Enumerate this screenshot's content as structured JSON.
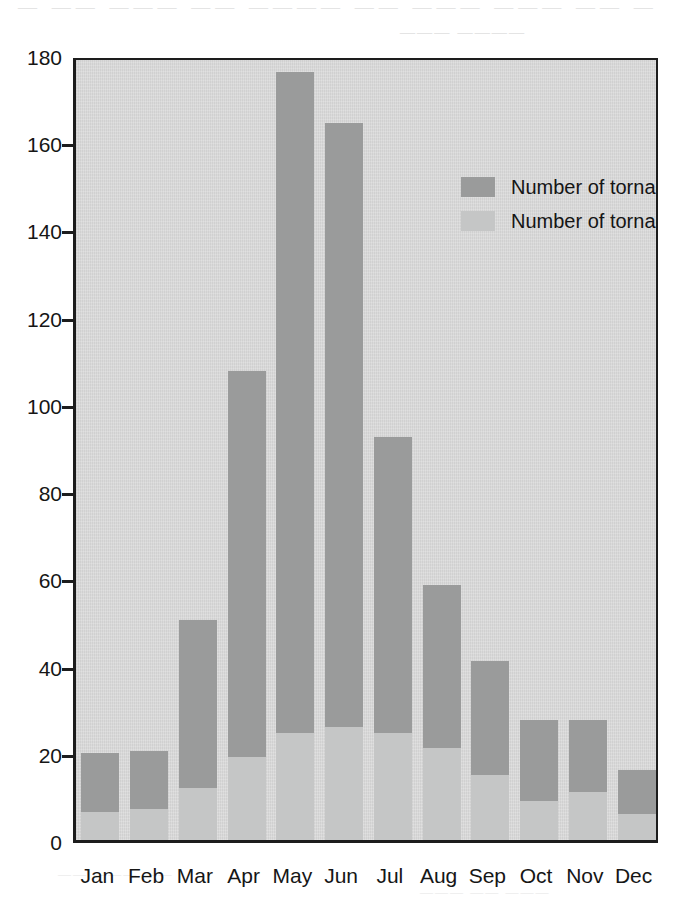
{
  "scan_artifacts": {
    "top_line": "— —— ——— —— ———— —— ——— ——— —— —",
    "sub_line": "——— ————",
    "low_line_a": "—— ——— ——",
    "low_line_b": "——— —— ———"
  },
  "legend": {
    "position": "inside-top-right",
    "items": [
      {
        "label": "Number of tornadoes",
        "color": "#9a9b9b",
        "swatch_name": "legend-swatch-tornadoes"
      },
      {
        "label": "Number of tornado days",
        "color": "#c5c6c6",
        "swatch_name": "legend-swatch-tornado-days"
      }
    ]
  },
  "colors": {
    "plot_background": "#d8d8d8",
    "axis": "#1d1d1d",
    "series_tornadoes": "#9a9b9b",
    "series_tornado_days": "#c5c6c6",
    "page_background": "#ffffff",
    "text": "#161616"
  },
  "chart_data": {
    "type": "bar",
    "title": "",
    "subtitle": "",
    "xlabel": "",
    "ylabel": "",
    "ylim": [
      0,
      180
    ],
    "yticks": [
      0,
      20,
      40,
      60,
      80,
      100,
      120,
      140,
      160,
      180
    ],
    "ytick_labels": [
      "0",
      "20",
      "40",
      "60",
      "80",
      "100",
      "120",
      "140",
      "160",
      "180"
    ],
    "grid": false,
    "stacked": true,
    "legend_position": "inside-top-right",
    "categories": [
      "Jan",
      "Feb",
      "Mar",
      "Apr",
      "May",
      "Jun",
      "Jul",
      "Aug",
      "Sep",
      "Oct",
      "Nov",
      "Dec"
    ],
    "series": [
      {
        "name": "Number of tornadoes",
        "color": "#9a9b9b",
        "values": [
          20,
          20.5,
          50.5,
          107.5,
          176,
          164.5,
          92.5,
          58.5,
          41,
          27.5,
          27.5,
          16
        ]
      },
      {
        "name": "Number of tornado days",
        "color": "#c5c6c6",
        "values": [
          6.5,
          7,
          12,
          19,
          24.5,
          26,
          24.5,
          21,
          15,
          9,
          11,
          6
        ]
      }
    ]
  }
}
